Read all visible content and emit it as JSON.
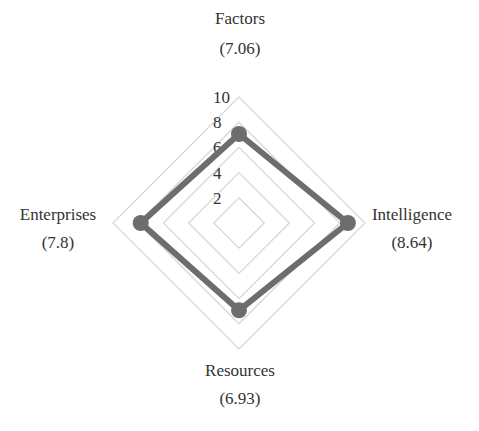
{
  "chart_data": {
    "type": "radar",
    "title": "",
    "axes": [
      "Factors",
      "Intelligence",
      "Resources",
      "Enterprises"
    ],
    "axis_value_labels": [
      "(7.06)",
      "(8.64)",
      "(6.93)",
      "(7.8)"
    ],
    "series": [
      {
        "name": "Score",
        "values": [
          7.06,
          8.64,
          6.93,
          7.8
        ]
      }
    ],
    "radial_ticks": [
      "2",
      "4",
      "6",
      "8",
      "10"
    ],
    "rlim": [
      0,
      10
    ],
    "grid": true,
    "grid_shape": "polygon",
    "legend": null,
    "colors": {
      "series": "#6d6d6d",
      "grid": "#d8d8d8",
      "text": "#333333"
    }
  }
}
